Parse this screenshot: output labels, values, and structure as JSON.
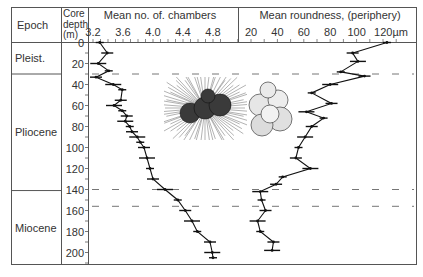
{
  "header": {
    "epoch_label": "Epoch",
    "depth_label_lines": [
      "Core",
      "depth",
      "(m)"
    ],
    "chambers_title": "Mean no. of. chambers",
    "roundness_title": "Mean roundness, (periphery)"
  },
  "epochs": [
    {
      "name": "Pleist.",
      "from_m": 0,
      "to_m": 30
    },
    {
      "name": "Pliocene",
      "from_m": 30,
      "to_m": 141
    },
    {
      "name": "Miocene",
      "from_m": 141,
      "to_m": 212
    }
  ],
  "depth_ticks": [
    "0",
    "20",
    "40",
    "60",
    "80",
    "100",
    "120",
    "140",
    "160",
    "180",
    "200"
  ],
  "chambers_ticks": [
    "3.2",
    "3.6",
    "4.0",
    "4.4",
    "4.8"
  ],
  "roundness_ticks": [
    "20",
    "40",
    "60",
    "80",
    "100",
    "120µm"
  ],
  "dashed_lines_m": [
    30,
    140,
    156
  ],
  "colors": {
    "ink": "#333333",
    "frame": "#555555",
    "curve": "#111111"
  },
  "chart_data": [
    {
      "type": "line",
      "title": "Mean no. of. chambers",
      "xlabel": "Mean no. of. chambers",
      "ylabel": "Core depth (m)",
      "xlim": [
        3.1,
        5.0
      ],
      "ylim": [
        212,
        0
      ],
      "grid": false,
      "x_ticks": [
        3.2,
        3.6,
        4.0,
        4.4,
        4.8
      ],
      "depth": [
        0,
        10,
        20,
        27,
        33,
        40,
        45,
        55,
        60,
        65,
        70,
        75,
        80,
        85,
        90,
        95,
        100,
        110,
        120,
        130,
        140,
        150,
        160,
        170,
        180,
        190,
        200,
        205
      ],
      "values": [
        3.29,
        3.39,
        3.27,
        3.41,
        3.24,
        3.47,
        3.59,
        3.57,
        3.48,
        3.59,
        3.65,
        3.63,
        3.69,
        3.72,
        3.79,
        3.83,
        3.88,
        3.92,
        3.96,
        4.0,
        4.16,
        4.33,
        4.43,
        4.52,
        4.59,
        4.76,
        4.79,
        4.8
      ]
    },
    {
      "type": "line",
      "title": "Mean roundness, (periphery)",
      "xlabel": "Mean roundness (µm)",
      "ylabel": "Core depth (m)",
      "xlim": [
        10,
        135
      ],
      "ylim": [
        212,
        0
      ],
      "grid": false,
      "x_ticks": [
        20,
        40,
        60,
        80,
        100,
        120
      ],
      "depth": [
        0,
        10,
        18,
        28,
        32,
        40,
        48,
        58,
        66,
        72,
        80,
        90,
        100,
        110,
        120,
        128,
        135,
        142,
        150,
        160,
        170,
        180,
        190,
        198
      ],
      "values": [
        123,
        97,
        101,
        88,
        106,
        80,
        66,
        81,
        62,
        75,
        66,
        61,
        56,
        54,
        65,
        44,
        39,
        27,
        28,
        31,
        25,
        27,
        37,
        36
      ]
    }
  ],
  "illustrations": [
    {
      "name": "spiny-foraminifera-illustration"
    },
    {
      "name": "globular-foraminifera-illustration"
    }
  ]
}
